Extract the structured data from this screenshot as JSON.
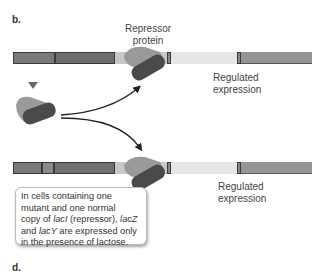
{
  "panels": {
    "top_label": "b.",
    "bottom_label": "d."
  },
  "labels": {
    "repressor_line1": "Repressor",
    "repressor_line2": "protein",
    "regulated_top_line1": "Regulated",
    "regulated_top_line2": "expression",
    "regulated_bottom_line1": "Regulated",
    "regulated_bottom_line2": "expression"
  },
  "callout": {
    "line1": "In cells containing one",
    "line2": "mutant and one normal",
    "line3_pre": "copy of ",
    "line3_gene1": "lacI",
    "line3_mid": " (repressor), ",
    "line3_gene2": "lacZ",
    "line4_pre": "and ",
    "line4_gene": "lacY",
    "line4_post": " are expressed only",
    "line5": "in the presence of lactose."
  },
  "colors": {
    "dna_dark": "#6e6e6e",
    "dna_mid": "#8a8a8a",
    "dna_operator": "#c8c8c8",
    "dna_spacer": "#e6e6e6",
    "dna_gene": "#959595",
    "protein_dark": "#4a4a4a",
    "protein_light": "#9a9a9a"
  }
}
